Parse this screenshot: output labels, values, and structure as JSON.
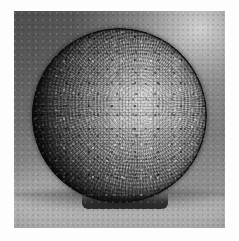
{
  "page": {
    "background_color": "#fdfdfd",
    "width": 239,
    "height": 241
  },
  "photograph": {
    "caption": "",
    "alt_text": "Black and white photograph of a circular mosaic plate",
    "frame": {
      "left": 14,
      "top": 11,
      "width": 211,
      "height": 217
    },
    "medium": "black-and-white photograph",
    "background_color": "#6e6e6e",
    "ground_color": "#b0b0b0",
    "highlight_color": "#d9d9d9",
    "shadow_color": "#101010"
  },
  "subject": {
    "name": "circular mosaic plate",
    "shape": "disc",
    "center_x": 107,
    "center_y": 105,
    "diameter": 175,
    "rim_color": "#141414",
    "center_color": "#c9c9c9",
    "tile_pattern": "concentric radial tesserae",
    "rests_on": "flat table surface"
  }
}
